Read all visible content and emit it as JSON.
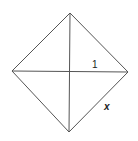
{
  "diagram": {
    "type": "square-with-diagonals",
    "stroke_color": "#555555",
    "vertices": {
      "top": [
        70,
        13
      ],
      "right": [
        128,
        72
      ],
      "bottom": [
        69,
        132
      ],
      "left": [
        12,
        71
      ]
    },
    "labels": {
      "half_diagonal": "1",
      "side": "x"
    }
  }
}
